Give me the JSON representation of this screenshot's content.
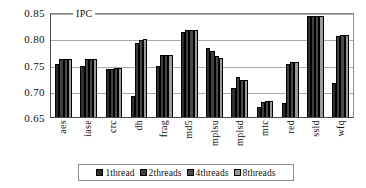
{
  "chart_data": {
    "type": "bar",
    "title": "IPC",
    "xlabel": "",
    "ylabel": "",
    "ylim": [
      0.65,
      0.85
    ],
    "yticks": [
      "0.65",
      "0.70",
      "0.75",
      "0.80",
      "0.85"
    ],
    "grid": true,
    "legend_position": "bottom",
    "categories": [
      "aes",
      "iase",
      "crc",
      "dh",
      "frag",
      "md5",
      "mplsu",
      "mplsd",
      "mtc",
      "red",
      "ssld",
      "wfq"
    ],
    "series": [
      {
        "name": "1thread",
        "color": "#2e2e2e",
        "values": [
          0.752,
          0.748,
          0.742,
          0.69,
          0.749,
          0.813,
          0.783,
          0.706,
          0.67,
          0.677,
          0.845,
          0.715
        ]
      },
      {
        "name": "2threads",
        "color": "#3f3f3f",
        "values": [
          0.762,
          0.762,
          0.743,
          0.793,
          0.77,
          0.817,
          0.776,
          0.726,
          0.679,
          0.752,
          0.845,
          0.806
        ]
      },
      {
        "name": "4threads",
        "color": "#4a4a4a",
        "values": [
          0.762,
          0.762,
          0.744,
          0.799,
          0.77,
          0.818,
          0.767,
          0.722,
          0.68,
          0.755,
          0.845,
          0.808
        ]
      },
      {
        "name": "8threads",
        "color": "#9a9a9a",
        "values": [
          0.762,
          0.762,
          0.744,
          0.8,
          0.77,
          0.818,
          0.763,
          0.721,
          0.68,
          0.756,
          0.845,
          0.808
        ]
      }
    ]
  }
}
